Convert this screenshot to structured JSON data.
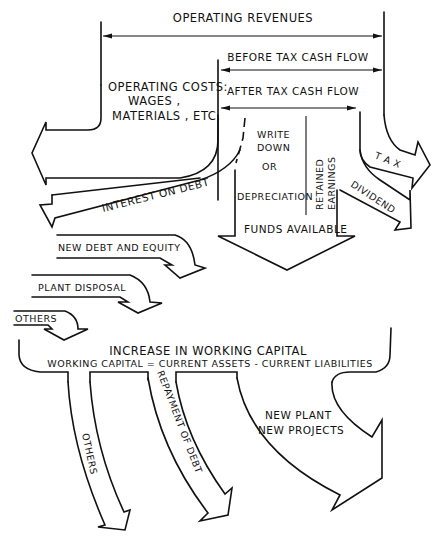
{
  "diagram": {
    "labels": {
      "operating_revenues": "OPERATING REVENUES",
      "before_tax_cash_flow": "BEFORE TAX CASH FLOW",
      "after_tax_cash_flow": "AFTER TAX CASH FLOW",
      "operating_costs_1": "OPERATING COSTS:",
      "operating_costs_2": "WAGES ,",
      "operating_costs_3": "MATERIALS , ETC.",
      "write": "WRITE",
      "down": "DOWN",
      "or": "OR",
      "depreciation": "DEPRECIATION",
      "retained": "RETAINED",
      "earnings": "EARNINGS",
      "tax": "T A X",
      "dividend": "DIVIDEND",
      "interest_on_debt": "INTEREST ON DEBT",
      "funds_available": "FUNDS AVAILABLE",
      "new_debt_equity": "NEW DEBT AND EQUITY",
      "plant_disposal": "PLANT DISPOSAL",
      "others_in": "OTHERS",
      "increase_working_capital": "INCREASE IN WORKING CAPITAL",
      "working_capital_def": "WORKING CAPITAL = CURRENT ASSETS - CURRENT LIABILITIES",
      "others_out": "OTHERS",
      "repayment_of_debt": "REPAYMENT OF DEBT",
      "new_plant": "NEW PLANT",
      "new_projects": "NEW PROJECTS"
    }
  }
}
